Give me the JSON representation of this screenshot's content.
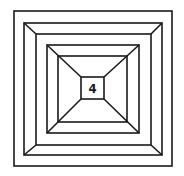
{
  "diagram": {
    "center_label": "4",
    "line_color": "#1a1a1a",
    "background": "#ffffff",
    "nested_square_count": 6
  }
}
